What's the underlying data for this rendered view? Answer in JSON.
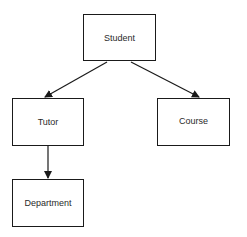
{
  "diagram": {
    "type": "hierarchy",
    "nodes": [
      {
        "id": "student",
        "label": "Student"
      },
      {
        "id": "tutor",
        "label": "Tutor"
      },
      {
        "id": "course",
        "label": "Course"
      },
      {
        "id": "department",
        "label": "Department"
      }
    ],
    "edges": [
      {
        "from": "student",
        "to": "tutor"
      },
      {
        "from": "student",
        "to": "course"
      },
      {
        "from": "tutor",
        "to": "department"
      }
    ],
    "colors": {
      "stroke": "#1a1a1a",
      "text": "#2a2a2a",
      "background": "#ffffff"
    }
  }
}
